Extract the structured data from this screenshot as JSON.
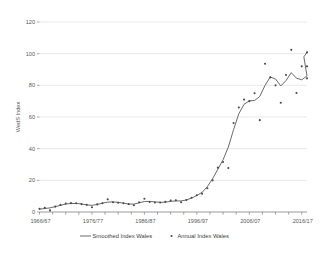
{
  "chart_data": {
    "type": "line",
    "title": "",
    "xlabel": "",
    "ylabel": "WedS Index",
    "ylim": [
      0,
      120
    ],
    "yticks": [
      0,
      20,
      40,
      60,
      80,
      100,
      120
    ],
    "ytick_labels": [
      "0",
      "20",
      "40",
      "60",
      "80",
      "100",
      "120"
    ],
    "grid": true,
    "legend_position": "bottom",
    "xtick_labels": [
      "1966/67",
      "1976/77",
      "1986/87",
      "1996/97",
      "2006/07",
      "2016/17"
    ],
    "xtick_years": [
      1966,
      1976,
      1986,
      1996,
      2006,
      2016
    ],
    "x_range": [
      1966,
      2017
    ],
    "x": [
      1966,
      1967,
      1968,
      1969,
      1970,
      1971,
      1972,
      1973,
      1974,
      1975,
      1976,
      1977,
      1978,
      1979,
      1980,
      1981,
      1982,
      1983,
      1984,
      1985,
      1986,
      1987,
      1988,
      1989,
      1990,
      1991,
      1992,
      1993,
      1994,
      1995,
      1996,
      1997,
      1998,
      1999,
      2000,
      2001,
      2002,
      2003,
      2004,
      2005,
      2006,
      2007,
      2008,
      2009,
      2010,
      2011,
      2012,
      2013,
      2014,
      2015,
      2016,
      2017
    ],
    "series": [
      {
        "name": "Annual Index Wales",
        "marker": "dot",
        "color": "#4a4a4a",
        "values": [
          2.0,
          2.6,
          1.0,
          3.4,
          4.5,
          5.4,
          5.6,
          5.5,
          5.0,
          4.6,
          3.0,
          4.8,
          5.5,
          8.0,
          6.2,
          5.8,
          5.5,
          5.0,
          4.3,
          6.2,
          8.4,
          6.3,
          6.0,
          6.0,
          6.4,
          7.3,
          7.4,
          6.2,
          7.6,
          9.0,
          10.6,
          11.6,
          15.0,
          20.0,
          28.0,
          31.6,
          27.8,
          56.2,
          66.0,
          71.0,
          70.0,
          75.0,
          58.0,
          93.6,
          85.0,
          80.0,
          69.0,
          86.5,
          102.4,
          75.2,
          92.0,
          92.0
        ]
      },
      {
        "name": "Smoothed Index Wales",
        "marker": "line",
        "color": "#595959",
        "values": [
          1.8,
          2.2,
          2.6,
          3.4,
          4.2,
          5.0,
          5.4,
          5.4,
          5.1,
          4.5,
          4.2,
          4.8,
          5.6,
          6.2,
          6.4,
          6.1,
          5.6,
          5.0,
          5.0,
          5.8,
          6.6,
          6.7,
          6.4,
          6.1,
          6.2,
          6.7,
          7.0,
          7.0,
          7.6,
          8.8,
          10.4,
          12.4,
          16.0,
          21.0,
          27.0,
          33.0,
          41.0,
          52.0,
          62.0,
          68.0,
          70.2,
          70.4,
          73.0,
          80.0,
          85.3,
          84.0,
          79.6,
          83.0,
          88.0,
          84.5,
          83.5,
          86.0
        ]
      }
    ],
    "extra_point": {
      "x": 2017,
      "y": 84.4
    },
    "final_points": [
      {
        "x": 2016.4,
        "y": 98.0
      },
      {
        "x": 2017,
        "y": 100.8
      }
    ],
    "legend": [
      {
        "label": "Smoothed Index Wales",
        "type": "line",
        "color": "#595959"
      },
      {
        "label": "Annual Index Wales",
        "type": "dot",
        "color": "#4a4a4a"
      }
    ]
  }
}
